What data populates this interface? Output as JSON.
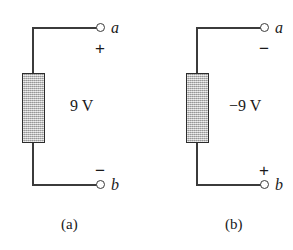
{
  "figure": {
    "background_color": "#ffffff",
    "wire_color": "#3b3b3b",
    "box_fill_color": "#bcbcbc",
    "box_border_color": "#2c2c2c",
    "text_color": "#1a1a1a"
  },
  "panels": [
    {
      "caption": "(a)",
      "top_terminal_label": "a",
      "top_terminal_sign": "+",
      "bottom_terminal_label": "b",
      "bottom_terminal_sign": "−",
      "source_value": "9 V"
    },
    {
      "caption": "(b)",
      "top_terminal_label": "a",
      "top_terminal_sign": "−",
      "bottom_terminal_label": "b",
      "bottom_terminal_sign": "+",
      "source_value": "−9 V"
    }
  ]
}
